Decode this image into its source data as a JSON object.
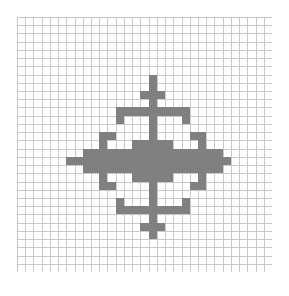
{
  "figure": {
    "background_color": "#ffffff",
    "grid": {
      "columns": 31,
      "rows": 31,
      "cell_size_px": 8.2258,
      "origin_x_px": 17,
      "origin_y_px": 17,
      "width_px": 255,
      "height_px": 255,
      "line_color": "#c9c9c9",
      "line_width_px": 1,
      "border_color": "#c9c9c9",
      "show_grid": true
    },
    "shape": {
      "name": "snowflake-cross",
      "fill_color": "#808080",
      "symmetry": "4-fold (horizontal and vertical mirror)",
      "center_column": 15,
      "center_row": 15,
      "bounds": {
        "min_col": 6,
        "max_col": 25,
        "min_row": 7,
        "max_row": 26
      },
      "filled_cells": [
        [
          16,
          7
        ],
        [
          16,
          8
        ],
        [
          15,
          9
        ],
        [
          16,
          9
        ],
        [
          17,
          9
        ],
        [
          16,
          10
        ],
        [
          12,
          11
        ],
        [
          13,
          11
        ],
        [
          14,
          11
        ],
        [
          15,
          11
        ],
        [
          16,
          11
        ],
        [
          17,
          11
        ],
        [
          18,
          11
        ],
        [
          19,
          11
        ],
        [
          20,
          11
        ],
        [
          12,
          12
        ],
        [
          16,
          12
        ],
        [
          20,
          12
        ],
        [
          16,
          13
        ],
        [
          10,
          14
        ],
        [
          11,
          14
        ],
        [
          16,
          14
        ],
        [
          21,
          14
        ],
        [
          22,
          14
        ],
        [
          10,
          15
        ],
        [
          14,
          15
        ],
        [
          15,
          15
        ],
        [
          16,
          15
        ],
        [
          17,
          15
        ],
        [
          18,
          15
        ],
        [
          22,
          15
        ],
        [
          8,
          16
        ],
        [
          9,
          16
        ],
        [
          10,
          16
        ],
        [
          11,
          16
        ],
        [
          12,
          16
        ],
        [
          13,
          16
        ],
        [
          14,
          16
        ],
        [
          15,
          16
        ],
        [
          16,
          16
        ],
        [
          17,
          16
        ],
        [
          18,
          16
        ],
        [
          19,
          16
        ],
        [
          20,
          16
        ],
        [
          21,
          16
        ],
        [
          22,
          16
        ],
        [
          23,
          16
        ],
        [
          24,
          16
        ],
        [
          6,
          17
        ],
        [
          7,
          17
        ],
        [
          8,
          17
        ],
        [
          9,
          17
        ],
        [
          10,
          17
        ],
        [
          11,
          17
        ],
        [
          12,
          17
        ],
        [
          13,
          17
        ],
        [
          14,
          17
        ],
        [
          15,
          17
        ],
        [
          16,
          17
        ],
        [
          17,
          17
        ],
        [
          18,
          17
        ],
        [
          19,
          17
        ],
        [
          20,
          17
        ],
        [
          21,
          17
        ],
        [
          22,
          17
        ],
        [
          23,
          17
        ],
        [
          24,
          17
        ],
        [
          25,
          17
        ],
        [
          8,
          18
        ],
        [
          9,
          18
        ],
        [
          10,
          18
        ],
        [
          11,
          18
        ],
        [
          12,
          18
        ],
        [
          13,
          18
        ],
        [
          14,
          18
        ],
        [
          15,
          18
        ],
        [
          16,
          18
        ],
        [
          17,
          18
        ],
        [
          18,
          18
        ],
        [
          19,
          18
        ],
        [
          20,
          18
        ],
        [
          21,
          18
        ],
        [
          22,
          18
        ],
        [
          23,
          18
        ],
        [
          24,
          18
        ],
        [
          10,
          19
        ],
        [
          14,
          19
        ],
        [
          15,
          19
        ],
        [
          16,
          19
        ],
        [
          17,
          19
        ],
        [
          18,
          19
        ],
        [
          22,
          19
        ],
        [
          10,
          20
        ],
        [
          11,
          20
        ],
        [
          16,
          20
        ],
        [
          21,
          20
        ],
        [
          22,
          20
        ],
        [
          16,
          21
        ],
        [
          12,
          22
        ],
        [
          16,
          22
        ],
        [
          20,
          22
        ],
        [
          12,
          23
        ],
        [
          13,
          23
        ],
        [
          14,
          23
        ],
        [
          15,
          23
        ],
        [
          16,
          23
        ],
        [
          17,
          23
        ],
        [
          18,
          23
        ],
        [
          19,
          23
        ],
        [
          20,
          23
        ],
        [
          16,
          24
        ],
        [
          15,
          25
        ],
        [
          16,
          25
        ],
        [
          17,
          25
        ],
        [
          16,
          26
        ]
      ]
    }
  }
}
